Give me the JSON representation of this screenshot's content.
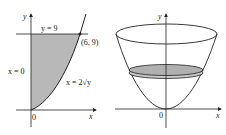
{
  "left_panel": {
    "axis_y_label": "y",
    "axis_x_label": "x",
    "origin_label": "0",
    "line_top_label": "y = 9",
    "left_boundary_label": "x = 0",
    "curve_label": "x = 2√y",
    "point_label": "(6, 9)",
    "region_fill": "#b8b8b8"
  },
  "right_panel": {
    "axis_y_label": "y",
    "axis_x_label": "x",
    "origin_label": "0",
    "disk_fill": "#b0b0b0"
  }
}
